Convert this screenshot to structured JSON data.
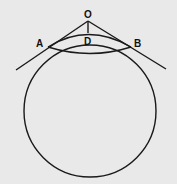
{
  "diagram": {
    "labels": {
      "O": "O",
      "A": "A",
      "B": "B",
      "D": "D"
    },
    "colors": {
      "background": "#e9e9e9",
      "stroke": "#1a1a1a"
    }
  }
}
